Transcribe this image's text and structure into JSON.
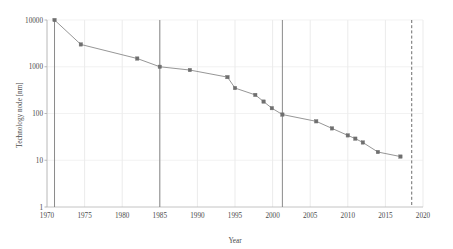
{
  "chart_data": {
    "type": "line",
    "title": "",
    "xlabel": "Year",
    "ylabel": "Technology node [nm]",
    "yscale": "log",
    "xlim": [
      1970,
      2020
    ],
    "ylim": [
      1,
      10000
    ],
    "grid": true,
    "legend": "none",
    "x_ticks": [
      "1970",
      "1975",
      "1980",
      "1985",
      "1990",
      "1995",
      "2000",
      "2005",
      "2010",
      "2015",
      "2020"
    ],
    "y_ticks": [
      "1",
      "10",
      "100",
      "1000",
      "10000"
    ],
    "series": [
      {
        "name": "Technology node",
        "marker": "square",
        "color": "#8a8a8a",
        "x": [
          1971,
          1974.5,
          1982,
          1985,
          1989,
          1994,
          1995,
          1997.7,
          1998.8,
          1999.9,
          2001.3,
          2005.8,
          2007.9,
          2010,
          2011,
          2012,
          2014,
          2017
        ],
        "y": [
          10000,
          3000,
          1500,
          1000,
          850,
          600,
          350,
          250,
          180,
          130,
          95,
          68,
          48,
          34,
          29,
          24,
          15,
          12
        ]
      }
    ],
    "annotations": [
      {
        "name": "vline-1971",
        "type": "vertical-line",
        "style": "solid",
        "x": 1971,
        "color": "#7d7d7d"
      },
      {
        "name": "vline-1985",
        "type": "vertical-line",
        "style": "solid",
        "x": 1985,
        "color": "#7d7d7d"
      },
      {
        "name": "vline-2001",
        "type": "vertical-line",
        "style": "solid",
        "x": 2001.3,
        "color": "#7d7d7d"
      },
      {
        "name": "vline-2018",
        "type": "vertical-line",
        "style": "dashed",
        "x": 2018.5,
        "color": "#5a5a5a"
      }
    ]
  }
}
